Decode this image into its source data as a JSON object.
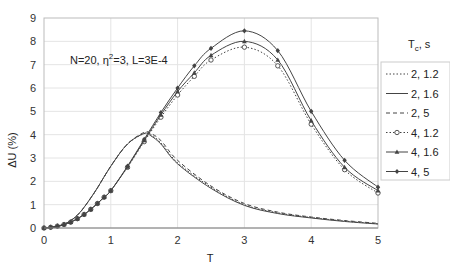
{
  "chart_data": {
    "type": "line",
    "title": "",
    "annotation": "N=20, η²=3, L=3E-4",
    "annotation_parts": {
      "a": "N=20, η",
      "sup": "2",
      "b": "=3, L=3E-4"
    },
    "xlabel": "T",
    "ylabel": "ΔU (%)",
    "xlim": [
      0,
      5
    ],
    "ylim": [
      0,
      9
    ],
    "xticks": [
      "0",
      "1",
      "2",
      "3",
      "4",
      "5"
    ],
    "yticks": [
      "0",
      "1",
      "2",
      "3",
      "4",
      "5",
      "6",
      "7",
      "8",
      "9"
    ],
    "grid": true,
    "legend_title": {
      "main": "T",
      "sub": "c",
      "rest": ", s"
    },
    "legend_position": "right",
    "series": [
      {
        "name": "2, 1.2",
        "style": "dotted",
        "marker": "none",
        "x": [
          0,
          0.25,
          0.5,
          0.75,
          1,
          1.25,
          1.5,
          1.6,
          1.75,
          2,
          2.5,
          3,
          3.5,
          4,
          4.5,
          5
        ],
        "y": [
          0,
          0.1,
          0.55,
          1.5,
          2.65,
          3.6,
          4.05,
          4.0,
          3.65,
          2.8,
          1.75,
          1.0,
          0.65,
          0.45,
          0.3,
          0.18
        ]
      },
      {
        "name": "2, 1.6",
        "style": "solid",
        "marker": "none",
        "x": [
          0,
          0.25,
          0.5,
          0.75,
          1,
          1.25,
          1.5,
          1.6,
          1.75,
          2,
          2.5,
          3,
          3.5,
          4,
          4.5,
          5
        ],
        "y": [
          0,
          0.1,
          0.55,
          1.5,
          2.65,
          3.6,
          4.05,
          3.95,
          3.6,
          2.75,
          1.7,
          0.97,
          0.62,
          0.43,
          0.28,
          0.17
        ]
      },
      {
        "name": "2, 5",
        "style": "dashed",
        "marker": "none",
        "x": [
          0,
          0.25,
          0.5,
          0.75,
          1,
          1.25,
          1.5,
          1.6,
          1.75,
          2,
          2.5,
          3,
          3.5,
          4,
          4.5,
          5
        ],
        "y": [
          0,
          0.1,
          0.55,
          1.5,
          2.65,
          3.6,
          4.1,
          4.05,
          3.75,
          2.9,
          1.8,
          1.05,
          0.68,
          0.47,
          0.32,
          0.2
        ]
      },
      {
        "name": "4, 1.2",
        "style": "dotted",
        "marker": "circle",
        "x": [
          0,
          0.1,
          0.2,
          0.3,
          0.4,
          0.5,
          0.6,
          0.7,
          0.8,
          0.9,
          1,
          1.25,
          1.5,
          1.75,
          2,
          2.25,
          2.5,
          3,
          3.5,
          4,
          4.5,
          5
        ],
        "y": [
          0,
          0.03,
          0.08,
          0.15,
          0.25,
          0.4,
          0.58,
          0.8,
          1.05,
          1.32,
          1.6,
          2.6,
          3.7,
          4.75,
          5.7,
          6.5,
          7.2,
          7.75,
          6.95,
          4.45,
          2.5,
          1.5
        ]
      },
      {
        "name": "4, 1.6",
        "style": "solid",
        "marker": "triangle",
        "x": [
          0,
          0.1,
          0.2,
          0.3,
          0.4,
          0.5,
          0.6,
          0.7,
          0.8,
          0.9,
          1,
          1.25,
          1.5,
          1.75,
          2,
          2.25,
          2.5,
          3,
          3.5,
          4,
          4.5,
          5
        ],
        "y": [
          0,
          0.03,
          0.08,
          0.15,
          0.25,
          0.4,
          0.58,
          0.8,
          1.05,
          1.32,
          1.6,
          2.62,
          3.75,
          4.85,
          5.85,
          6.65,
          7.4,
          8.0,
          7.2,
          4.6,
          2.6,
          1.6
        ]
      },
      {
        "name": "4, 5",
        "style": "solid",
        "marker": "diamond",
        "x": [
          0,
          0.1,
          0.2,
          0.3,
          0.4,
          0.5,
          0.6,
          0.7,
          0.8,
          0.9,
          1,
          1.25,
          1.5,
          1.75,
          2,
          2.25,
          2.5,
          3,
          3.5,
          4,
          4.5,
          5
        ],
        "y": [
          0,
          0.03,
          0.08,
          0.15,
          0.25,
          0.4,
          0.58,
          0.8,
          1.05,
          1.32,
          1.6,
          2.65,
          3.8,
          4.95,
          6.0,
          6.95,
          7.7,
          8.45,
          7.6,
          5.0,
          2.9,
          1.75
        ]
      }
    ]
  }
}
